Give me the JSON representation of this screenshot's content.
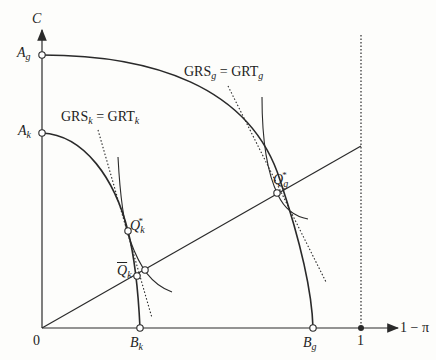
{
  "diagram": {
    "axes": {
      "y_label": "C",
      "x_label": "1 − π",
      "origin_label": "0",
      "x_tick_label": "1"
    },
    "points": {
      "A_g": {
        "base": "A",
        "sub": "g"
      },
      "A_k": {
        "base": "A",
        "sub": "k"
      },
      "B_k": {
        "base": "B",
        "sub": "k"
      },
      "B_g": {
        "base": "B",
        "sub": "g"
      },
      "Q_k_star": {
        "base": "Q",
        "sub": "k",
        "sup": "*"
      },
      "Q_g_star": {
        "base": "Q",
        "sub": "g",
        "sup": "*"
      },
      "Q_k_bar": {
        "base": "Q",
        "sub": "k"
      }
    },
    "annotations": {
      "k_condition": {
        "lhs": "GRS",
        "lhs_sub": "k",
        "eq": " = ",
        "rhs": "GRT",
        "rhs_sub": "k"
      },
      "g_condition": {
        "lhs": "GRS",
        "lhs_sub": "g",
        "eq": " = ",
        "rhs": "GRT",
        "rhs_sub": "g"
      }
    },
    "colors": {
      "line": "#2a2a2a",
      "background": "#fdfdfb"
    }
  }
}
